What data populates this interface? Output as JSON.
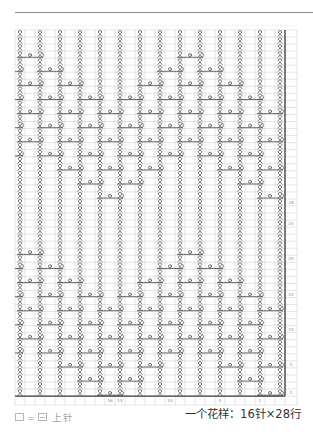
{
  "chart": {
    "total_rows": 52,
    "total_cols": 27,
    "pattern_rows": 28,
    "twisted_column_count": 14,
    "symbols": {
      "twisted": "twisted-knit-stitch-icon",
      "yarn_over": "yarn-over-icon",
      "motif_end": "twisted-knit-end-icon",
      "blank": "purl"
    },
    "motif_rows": {
      "1": [
        5,
        13
      ],
      "3": [
        4,
        6,
        12
      ],
      "5": [
        3,
        5,
        7,
        11,
        13
      ],
      "7": [
        0,
        2,
        4,
        6,
        8,
        10,
        12
      ],
      "9": [
        1,
        3,
        5,
        7,
        9,
        11,
        13
      ],
      "11": [
        0,
        2,
        4,
        6,
        8,
        10,
        12
      ],
      "13": [
        1,
        3,
        5,
        7,
        9,
        11,
        13
      ],
      "15": [
        0,
        2,
        4,
        6,
        8,
        10,
        12
      ],
      "17": [
        1,
        3,
        7,
        9,
        11
      ],
      "19": [
        0,
        2,
        8,
        10
      ],
      "21": [
        1,
        9
      ]
    },
    "row_labels": [
      {
        "row": 1,
        "label": "1"
      },
      {
        "row": 5,
        "label": "5"
      },
      {
        "row": 10,
        "label": "10"
      },
      {
        "row": 15,
        "label": "15"
      },
      {
        "row": 20,
        "label": "20"
      },
      {
        "row": 25,
        "label": "25"
      },
      {
        "row": 28,
        "label": "28"
      }
    ],
    "col_labels": [
      {
        "col": 9,
        "label": "16"
      },
      {
        "col": 10,
        "label": "15"
      },
      {
        "col": 15,
        "label": "10"
      },
      {
        "col": 20,
        "label": "5"
      },
      {
        "col": 24,
        "label": "1"
      }
    ],
    "colors": {
      "grid": "#c9c9c9",
      "symbol": "#4a4a4a",
      "border": "#3a3a3a",
      "label": "#8a8a8a"
    }
  },
  "legend": {
    "blank_symbol": "□",
    "equals": "=",
    "purl_symbol": "⊟",
    "purl_label": "上针"
  },
  "repeat_info": {
    "text": "一个花样：16针×28行"
  }
}
